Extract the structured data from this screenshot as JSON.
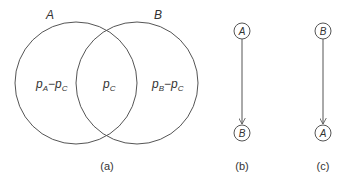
{
  "venn": {
    "set_a_label": "A",
    "set_b_label": "B",
    "region_a_only": {
      "base": "p",
      "sub1": "A",
      "minus": "−",
      "base2": "p",
      "sub2": "C"
    },
    "region_intersection": {
      "base": "p",
      "sub": "C"
    },
    "region_b_only": {
      "base": "p",
      "sub1": "B",
      "minus": "−",
      "base2": "p",
      "sub2": "C"
    },
    "caption": "(a)"
  },
  "graph_b": {
    "top_node": "A",
    "bottom_node": "B",
    "caption": "(b)"
  },
  "graph_c": {
    "top_node": "B",
    "bottom_node": "A",
    "caption": "(c)"
  },
  "colors": {
    "stroke": "#555555",
    "text": "#333333"
  }
}
